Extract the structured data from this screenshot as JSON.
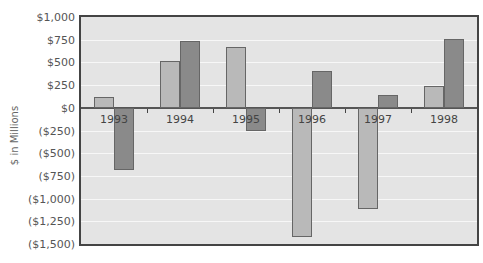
{
  "chart_data": {
    "type": "bar",
    "title": "",
    "xlabel": "",
    "ylabel": "$ in Millions",
    "categories": [
      "1993",
      "1994",
      "1995",
      "1996",
      "1997",
      "1998"
    ],
    "series": [
      {
        "name": "Series 1",
        "color": "#b9b9b9",
        "values": [
          120,
          520,
          670,
          -1425,
          -1120,
          240
        ]
      },
      {
        "name": "Series 2",
        "color": "#8a8a8a",
        "values": [
          -680,
          740,
          -260,
          400,
          140,
          760
        ]
      }
    ],
    "ylim": [
      -1500,
      1000
    ],
    "yticks": [
      1000,
      750,
      500,
      250,
      0,
      -250,
      -500,
      -750,
      -1000,
      -1250,
      -1500
    ],
    "ytick_labels": [
      "$1,000",
      "$750",
      "$500",
      "$250",
      "$0",
      "($250)",
      "($500)",
      "($750)",
      "($1,000)",
      "($1,250)",
      "($1,500)"
    ],
    "grid": true,
    "legend": "none"
  }
}
